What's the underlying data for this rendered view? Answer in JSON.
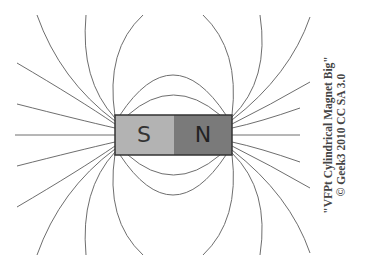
{
  "diagram": {
    "magnet": {
      "south_label": "S",
      "north_label": "N",
      "south_color": "#b3b3b3",
      "north_color": "#7a7a7a"
    },
    "line_color": "#6e6e6e"
  },
  "credit": {
    "line1": "\"VFPt Cylindrical Magnet Big\"",
    "line2": "© Geek3 2010 CC SA 3.0"
  }
}
